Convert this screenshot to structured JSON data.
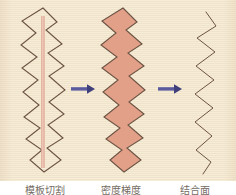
{
  "figure": {
    "width": 236,
    "height": 195,
    "panel": {
      "background_color": "#f7ecd6",
      "x": 0,
      "y": 0,
      "width": 236,
      "height": 181
    },
    "caption_strip_background": "#ffffff"
  },
  "colors": {
    "paper": "#f7ecd6",
    "stroke": "#6b5343",
    "fill_salmon": "#e3a088",
    "center_line": "#e8b4a2",
    "arrow": "#5a5a9e",
    "caption_text": "#5b5148"
  },
  "stages": [
    {
      "id": "stage-outline",
      "label": "模板切割",
      "description": "zigzag outline with central pink axis line",
      "fill": "none",
      "has_center_line": true,
      "stroke_width": 1.1,
      "bbox": {
        "x": 20,
        "y": 8,
        "width": 46,
        "height": 165
      }
    },
    {
      "id": "stage-filled",
      "label": "密度梯度",
      "description": "zigzag silhouette filled with salmon color",
      "fill": "#e3a088",
      "has_center_line": false,
      "stroke_width": 1.1,
      "bbox": {
        "x": 100,
        "y": 8,
        "width": 46,
        "height": 165
      }
    },
    {
      "id": "stage-line",
      "label": "结合面",
      "description": "thin narrow zigzag polyline only",
      "fill": "none",
      "has_center_line": false,
      "stroke_width": 1.0,
      "bbox": {
        "x": 192,
        "y": 12,
        "width": 26,
        "height": 162
      }
    }
  ],
  "arrows": [
    {
      "id": "arrow-1",
      "from": "stage-outline",
      "to": "stage-filled",
      "x": 71,
      "y": 89,
      "length": 24,
      "direction": "right",
      "color": "#5a5a9e"
    },
    {
      "id": "arrow-2",
      "from": "stage-filled",
      "to": "stage-line",
      "x": 158,
      "y": 89,
      "length": 24,
      "direction": "right",
      "color": "#5a5a9e"
    }
  ],
  "geometry": {
    "zigzag_outline_points": "43,8 57,22 46,30 62,44 48,53 64,66 49,76 65,90 49,102 64,114 48,125 63,138 47,148 61,160 44,172 30,160 42,150 26,139 40,128 24,117 39,105 23,92 38,80 22,68 37,57 21,45 36,33 22,21",
    "zigzag_line_points": "206,12 216,26 197,38 215,52 196,66 214,80 195,94 213,108 195,122 212,136 196,150 211,162 203,174"
  },
  "captions": {
    "items": [
      {
        "id": "caption-0",
        "text": "模板切割"
      },
      {
        "id": "caption-1",
        "text": "密度梯度"
      },
      {
        "id": "caption-2",
        "text": "结合面"
      }
    ]
  }
}
